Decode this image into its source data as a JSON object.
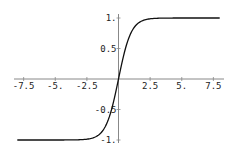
{
  "chart_data": {
    "type": "line",
    "title": "",
    "xlabel": "",
    "ylabel": "",
    "function": "tanh(x)",
    "xlim": [
      -8,
      8
    ],
    "ylim": [
      -1,
      1
    ],
    "grid": false,
    "x_ticks": [
      {
        "value": -7.5,
        "label": "-7.5"
      },
      {
        "value": -5,
        "label": "-5."
      },
      {
        "value": -2.5,
        "label": "-2.5"
      },
      {
        "value": 2.5,
        "label": "2.5"
      },
      {
        "value": 5,
        "label": "5."
      },
      {
        "value": 7.5,
        "label": "7.5"
      }
    ],
    "y_ticks": [
      {
        "value": 1,
        "label": "1."
      },
      {
        "value": 0.5,
        "label": "0.5"
      },
      {
        "value": -0.5,
        "label": "-0.5"
      },
      {
        "value": -1,
        "label": "-1."
      }
    ],
    "series": [
      {
        "name": "tanh",
        "x": [
          -8,
          -4,
          -3,
          -2,
          -1.5,
          -1,
          -0.5,
          0,
          0.5,
          1,
          1.5,
          2,
          3,
          4,
          8
        ],
        "values": [
          -1.0,
          -0.999,
          -0.995,
          -0.964,
          -0.905,
          -0.762,
          -0.462,
          0,
          0.462,
          0.762,
          0.905,
          0.964,
          0.995,
          0.999,
          1.0
        ]
      }
    ],
    "colors": {
      "line": "#111111",
      "axis": "#888888"
    }
  }
}
